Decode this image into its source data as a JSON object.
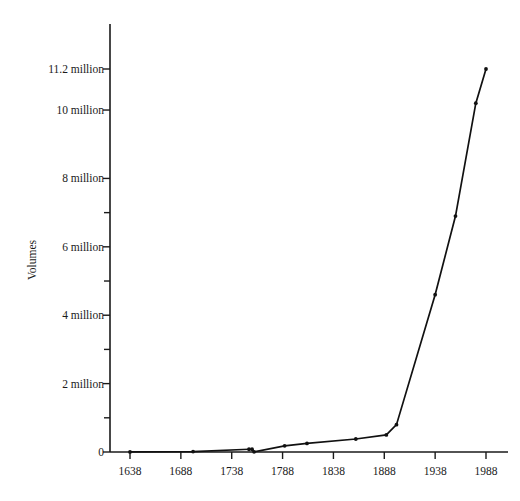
{
  "chart_data": {
    "type": "line",
    "title": "",
    "subtitle": "",
    "xlabel": "",
    "ylabel": "Volumes",
    "xlim": [
      1618,
      1998
    ],
    "ylim": [
      0,
      11600000
    ],
    "grid": false,
    "legend": null,
    "x_ticks": [
      1638,
      1688,
      1738,
      1788,
      1838,
      1888,
      1938,
      1988
    ],
    "x_tick_labels": [
      "1638",
      "1688",
      "1738",
      "1788",
      "1838",
      "1888",
      "1938",
      "1988"
    ],
    "y_ticks": [
      0,
      1000000,
      2000000,
      3000000,
      4000000,
      5000000,
      6000000,
      7000000,
      8000000,
      10000000,
      11200000
    ],
    "y_tick_labels": [
      "0",
      "",
      "2 million",
      "",
      "4 million",
      "",
      "6 million",
      "",
      "8 million",
      "10 million",
      "11.2 million"
    ],
    "y_major_ticks": [
      0,
      2000000,
      4000000,
      6000000,
      8000000,
      10000000,
      11200000
    ],
    "y_minor_ticks": [
      1000000,
      3000000,
      5000000,
      7000000
    ],
    "series": [
      {
        "name": "Volumes",
        "marker": "dot",
        "color": "#111111",
        "x": [
          1638,
          1700,
          1755,
          1758,
          1760,
          1790,
          1812,
          1860,
          1890,
          1900,
          1938,
          1958,
          1978,
          1988
        ],
        "y": [
          3000,
          12000,
          80000,
          80000,
          5000,
          180000,
          250000,
          380000,
          500000,
          800000,
          4600000,
          6900000,
          10200000,
          11200000
        ]
      }
    ],
    "annotations": []
  }
}
